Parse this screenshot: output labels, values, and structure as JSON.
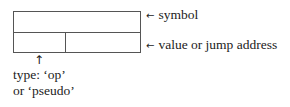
{
  "diagram": {
    "type": "record-structure",
    "box": {
      "fields": [
        {
          "id": "symbol",
          "row": 1,
          "span": "full"
        },
        {
          "id": "type",
          "row": 2,
          "span": "left"
        },
        {
          "id": "value",
          "row": 2,
          "span": "right"
        }
      ]
    },
    "labels": {
      "symbol": {
        "arrow": "←",
        "text": "symbol"
      },
      "value": {
        "arrow": "←",
        "text": "value or jump address"
      },
      "type": {
        "arrow": "↑",
        "line1": "type: ‘op’",
        "line2": "or ‘pseudo’"
      }
    }
  }
}
